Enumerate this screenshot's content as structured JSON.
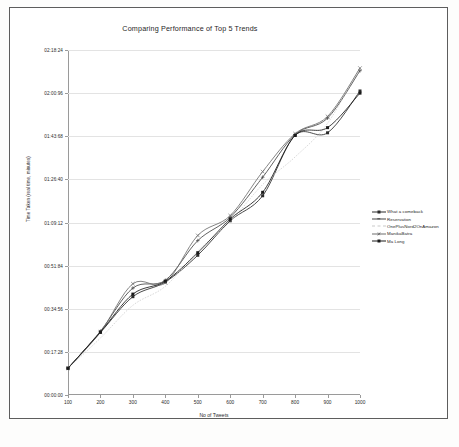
{
  "chart_data": {
    "type": "line",
    "title": "Comparing Performance of Top 5 Trends",
    "xlabel": "No of Tweets",
    "ylabel": "Time Taken (real time, minutes)",
    "x": [
      100,
      200,
      300,
      400,
      500,
      600,
      700,
      800,
      900,
      1000
    ],
    "xlim": [
      100,
      1000
    ],
    "ytick_labels": [
      "00:00:00",
      "00:17:28",
      "00:34:56",
      "00:51:84",
      "01:09:12",
      "01:26:40",
      "01:43:68",
      "02:00:96",
      "02:18:24"
    ],
    "ytick_values": [
      0,
      1,
      2,
      3,
      4,
      5,
      6,
      7,
      8
    ],
    "ylim": [
      0,
      8
    ],
    "grid": true,
    "legend_position": "right",
    "series": [
      {
        "name": "What a comeback",
        "color": "#2b2b2b",
        "marker": "square",
        "dashed": false,
        "values": [
          0.62,
          1.45,
          2.28,
          2.62,
          3.24,
          4.04,
          4.62,
          6.02,
          6.08,
          7.05
        ]
      },
      {
        "name": "Reservation",
        "color": "#444444",
        "marker": "plus",
        "dashed": false,
        "values": [
          0.62,
          1.48,
          2.48,
          2.66,
          3.58,
          4.12,
          5.05,
          6.04,
          6.42,
          7.52
        ]
      },
      {
        "name": "OnePlusNord2OnAmazon",
        "color": "#c9c9c9",
        "marker": "none",
        "dashed": true,
        "values": [
          0.62,
          1.32,
          2.08,
          2.52,
          3.34,
          4.02,
          4.88,
          5.52,
          6.3,
          7.6
        ]
      },
      {
        "name": "ManikaBatra",
        "color": "#6e6e6e",
        "marker": "cross",
        "dashed": false,
        "values": [
          0.62,
          1.46,
          2.58,
          2.6,
          3.7,
          4.16,
          5.18,
          6.06,
          6.46,
          7.58
        ]
      },
      {
        "name": "Ma Long",
        "color": "#1a1a1a",
        "marker": "square-filled",
        "dashed": false,
        "values": [
          0.62,
          1.46,
          2.34,
          2.64,
          3.3,
          4.08,
          4.7,
          6.02,
          6.2,
          7.0
        ]
      }
    ]
  },
  "caption": {
    "text": ""
  }
}
